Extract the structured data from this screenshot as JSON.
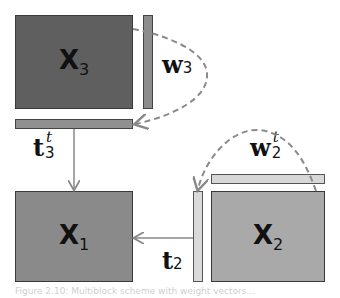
{
  "colors": {
    "x3_fill": "#5f5f5f",
    "w3_fill": "#8c8c8c",
    "t3_fill": "#909090",
    "x1_fill": "#8a8a8a",
    "x2_fill": "#a9a9a9",
    "w2_fill": "#d7d7d7",
    "t2_fill": "#d9d9d9",
    "arrow": "#888888",
    "dashed": "#8a8a8a"
  },
  "blocks": {
    "x3": {
      "name": "X",
      "sub": "3"
    },
    "x1": {
      "name": "X",
      "sub": "1"
    },
    "x2": {
      "name": "X",
      "sub": "2"
    }
  },
  "vectors": {
    "w3": {
      "name": "w",
      "sub": "3",
      "sup": ""
    },
    "t3t": {
      "name": "t",
      "sub": "3",
      "sup": "t"
    },
    "w2t": {
      "name": "w",
      "sub": "2",
      "sup": "t"
    },
    "t2": {
      "name": "t",
      "sub": "2",
      "sup": ""
    }
  },
  "caption": "Figure 2.10: Multiblock scheme with weight vectors..."
}
